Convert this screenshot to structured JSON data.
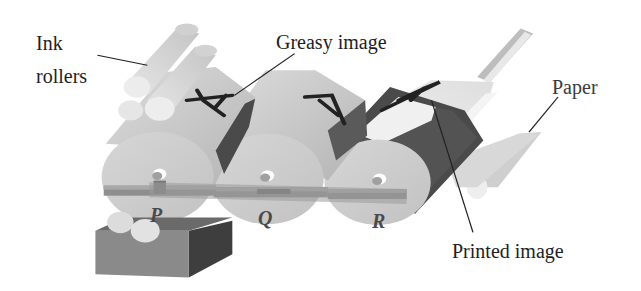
{
  "diagram": {
    "type": "offset lithography printing press",
    "labels": {
      "ink_rollers_line1": "Ink",
      "ink_rollers_line2": "rollers",
      "greasy_image": "Greasy image",
      "paper": "Paper",
      "printed_image": "Printed image"
    },
    "rollers": [
      {
        "id": "P",
        "label": "P"
      },
      {
        "id": "Q",
        "label": "Q"
      },
      {
        "id": "R",
        "label": "R"
      }
    ],
    "image_glyph": "A",
    "colors": {
      "background": "#ffffff",
      "roller_light": "#cfcfcf",
      "roller_mid": "#b9b9b9",
      "roller_dark": "#5a5a5a",
      "shadow": "#3c3c3c",
      "text": "#1e1e1e",
      "roller_letters": "#4a4a4a"
    }
  }
}
